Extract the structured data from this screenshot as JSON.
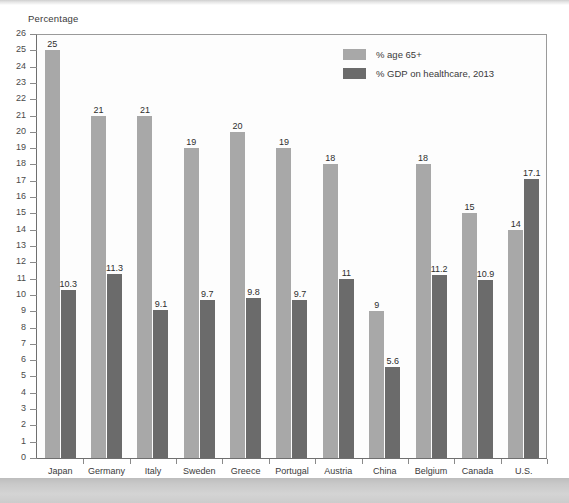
{
  "figure": {
    "axis_title": "Percentage"
  },
  "legend": {
    "position": "top-right",
    "entries": [
      {
        "label": "% age 65+",
        "color": "#a8a8a8",
        "swatch_name": "legend-swatch-age65"
      },
      {
        "label": "% GDP on healthcare, 2013",
        "color": "#6b6b6b",
        "swatch_name": "legend-swatch-gdp"
      }
    ]
  },
  "chart_data": {
    "type": "bar",
    "title": "",
    "subtitle": "",
    "xlabel": "",
    "ylabel": "Percentage",
    "ylim": [
      0,
      26
    ],
    "ytick_step": 1,
    "yticks": [
      0,
      1,
      2,
      3,
      4,
      5,
      6,
      7,
      8,
      9,
      10,
      11,
      12,
      13,
      14,
      15,
      16,
      17,
      18,
      19,
      20,
      21,
      22,
      23,
      24,
      25,
      26
    ],
    "ytick_labels": [
      "0",
      "1",
      "2",
      "3",
      "4",
      "5",
      "6",
      "7",
      "8",
      "9",
      "10",
      "11",
      "12",
      "13",
      "14",
      "15",
      "16",
      "17",
      "18",
      "19",
      "20",
      "21",
      "22",
      "23",
      "24",
      "25",
      "26"
    ],
    "grid": false,
    "legend_position": "top-right",
    "categories": [
      "Japan",
      "Germany",
      "Italy",
      "Sweden",
      "Greece",
      "Portugal",
      "Austria",
      "China",
      "Belgium",
      "Canada",
      "U.S."
    ],
    "series": [
      {
        "name": "% age 65+",
        "color": "#a8a8a8",
        "values": [
          25,
          21,
          21,
          19,
          20,
          19,
          18,
          9,
          18,
          15,
          14
        ],
        "value_labels": [
          "25",
          "21",
          "21",
          "19",
          "20",
          "19",
          "18",
          "9",
          "18",
          "15",
          "14"
        ]
      },
      {
        "name": "% GDP on healthcare, 2013",
        "color": "#6b6b6b",
        "values": [
          10.3,
          11.3,
          9.1,
          9.7,
          9.8,
          9.7,
          11,
          5.6,
          11.2,
          10.9,
          17.1
        ],
        "value_labels": [
          "10.3",
          "11.3",
          "9.1",
          "9.7",
          "9.8",
          "9.7",
          "11",
          "5.6",
          "11.2",
          "10.9",
          "17.1"
        ]
      }
    ]
  }
}
